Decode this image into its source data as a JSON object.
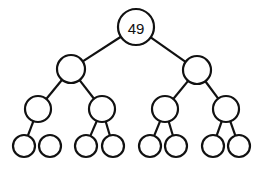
{
  "diagram": {
    "type": "binary-tree",
    "colors": {
      "stroke": "#111111",
      "fill": "#ffffff",
      "background": "#ffffff"
    },
    "nodes": [
      {
        "id": "root",
        "label": "49",
        "cx": 136,
        "cy": 27,
        "r": 18
      },
      {
        "id": "L",
        "label": "",
        "cx": 71,
        "cy": 69,
        "r": 14
      },
      {
        "id": "R",
        "label": "",
        "cx": 197,
        "cy": 70,
        "r": 14
      },
      {
        "id": "LL",
        "label": "",
        "cx": 38,
        "cy": 109,
        "r": 13
      },
      {
        "id": "LR",
        "label": "",
        "cx": 102,
        "cy": 109,
        "r": 13
      },
      {
        "id": "RL",
        "label": "",
        "cx": 165,
        "cy": 109,
        "r": 13
      },
      {
        "id": "RR",
        "label": "",
        "cx": 226,
        "cy": 109,
        "r": 13
      },
      {
        "id": "LLL",
        "label": "",
        "cx": 24,
        "cy": 146,
        "r": 11
      },
      {
        "id": "LLR",
        "label": "",
        "cx": 50,
        "cy": 146,
        "r": 11
      },
      {
        "id": "LRL",
        "label": "",
        "cx": 86,
        "cy": 146,
        "r": 11
      },
      {
        "id": "LRR",
        "label": "",
        "cx": 113,
        "cy": 146,
        "r": 11
      },
      {
        "id": "RLL",
        "label": "",
        "cx": 150,
        "cy": 146,
        "r": 11
      },
      {
        "id": "RLR",
        "label": "",
        "cx": 176,
        "cy": 146,
        "r": 11
      },
      {
        "id": "RRL",
        "label": "",
        "cx": 213,
        "cy": 146,
        "r": 11
      },
      {
        "id": "RRR",
        "label": "",
        "cx": 239,
        "cy": 146,
        "r": 11
      }
    ],
    "edges": [
      [
        "root",
        "L"
      ],
      [
        "root",
        "R"
      ],
      [
        "L",
        "LL"
      ],
      [
        "L",
        "LR"
      ],
      [
        "R",
        "RL"
      ],
      [
        "R",
        "RR"
      ],
      [
        "LL",
        "LLL"
      ],
      [
        "LR",
        "LRL"
      ],
      [
        "LR",
        "LRR"
      ],
      [
        "RL",
        "RLL"
      ],
      [
        "RL",
        "RLR"
      ],
      [
        "RR",
        "RRL"
      ],
      [
        "RR",
        "RRR"
      ]
    ]
  }
}
